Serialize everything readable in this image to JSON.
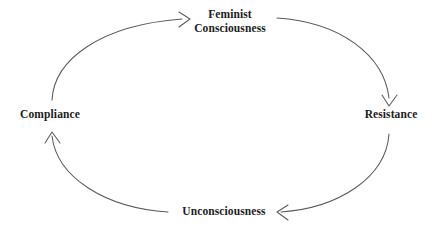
{
  "diagram": {
    "type": "cycle",
    "title": "",
    "background_color": "#ffffff",
    "stroke_color": "#5a5a5a",
    "text_color": "#1c1c1c",
    "nodes": [
      {
        "id": "feminist-consciousness",
        "label": "Feminist Consciousness",
        "line1": "Feminist",
        "line2": "Consciousness",
        "position": "top"
      },
      {
        "id": "resistance",
        "label": "Resistance",
        "position": "right"
      },
      {
        "id": "unconsciousness",
        "label": "Unconsciousness",
        "position": "bottom"
      },
      {
        "id": "compliance",
        "label": "Compliance",
        "position": "left"
      }
    ],
    "edges": [
      {
        "from": "compliance",
        "to": "feminist-consciousness",
        "arrow_direction": "right",
        "quadrant": "upper-left"
      },
      {
        "from": "feminist-consciousness",
        "to": "resistance",
        "arrow_direction": "down",
        "quadrant": "upper-right"
      },
      {
        "from": "resistance",
        "to": "unconsciousness",
        "arrow_direction": "left",
        "quadrant": "lower-right"
      },
      {
        "from": "unconsciousness",
        "to": "compliance",
        "arrow_direction": "up",
        "quadrant": "lower-left"
      }
    ]
  }
}
